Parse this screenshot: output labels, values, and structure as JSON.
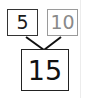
{
  "diagram": {
    "type": "number-bond",
    "parts": [
      {
        "value": "5",
        "color": "#1a1a1a"
      },
      {
        "value": "10",
        "color": "#8a8a8a"
      }
    ],
    "whole": {
      "value": "15",
      "color": "#111111"
    }
  }
}
